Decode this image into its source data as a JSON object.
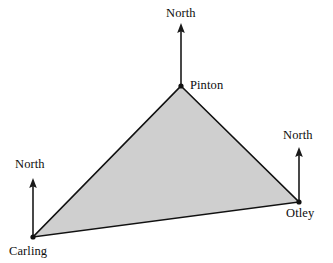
{
  "figure": {
    "width": 333,
    "height": 263,
    "background_color": "#ffffff"
  },
  "style": {
    "fill_color": "#cfcfcf",
    "stroke_color": "#111111",
    "stroke_width": 1.6,
    "arrow_color": "#1a1a1a",
    "text_color": "#0d0d0d"
  },
  "stations": [
    {
      "id": "pinton",
      "label": "Pinton",
      "x": 181,
      "y": 86,
      "north_label": "North",
      "arrow_tip_x": 181,
      "arrow_tip_y": 23
    },
    {
      "id": "otley",
      "label": "Otley",
      "x": 299,
      "y": 202,
      "north_label": "North",
      "arrow_tip_x": 299,
      "arrow_tip_y": 147
    },
    {
      "id": "carling",
      "label": "Carling",
      "x": 33,
      "y": 237,
      "north_label": "North",
      "arrow_tip_x": 33,
      "arrow_tip_y": 178
    }
  ],
  "triangle": {
    "points": "181,86 299,202 33,237",
    "edges": [
      {
        "id": "pinton-otley",
        "from": "pinton",
        "to": "otley"
      },
      {
        "id": "otley-carling",
        "from": "otley",
        "to": "carling"
      },
      {
        "id": "carling-pinton",
        "from": "carling",
        "to": "pinton"
      }
    ]
  }
}
